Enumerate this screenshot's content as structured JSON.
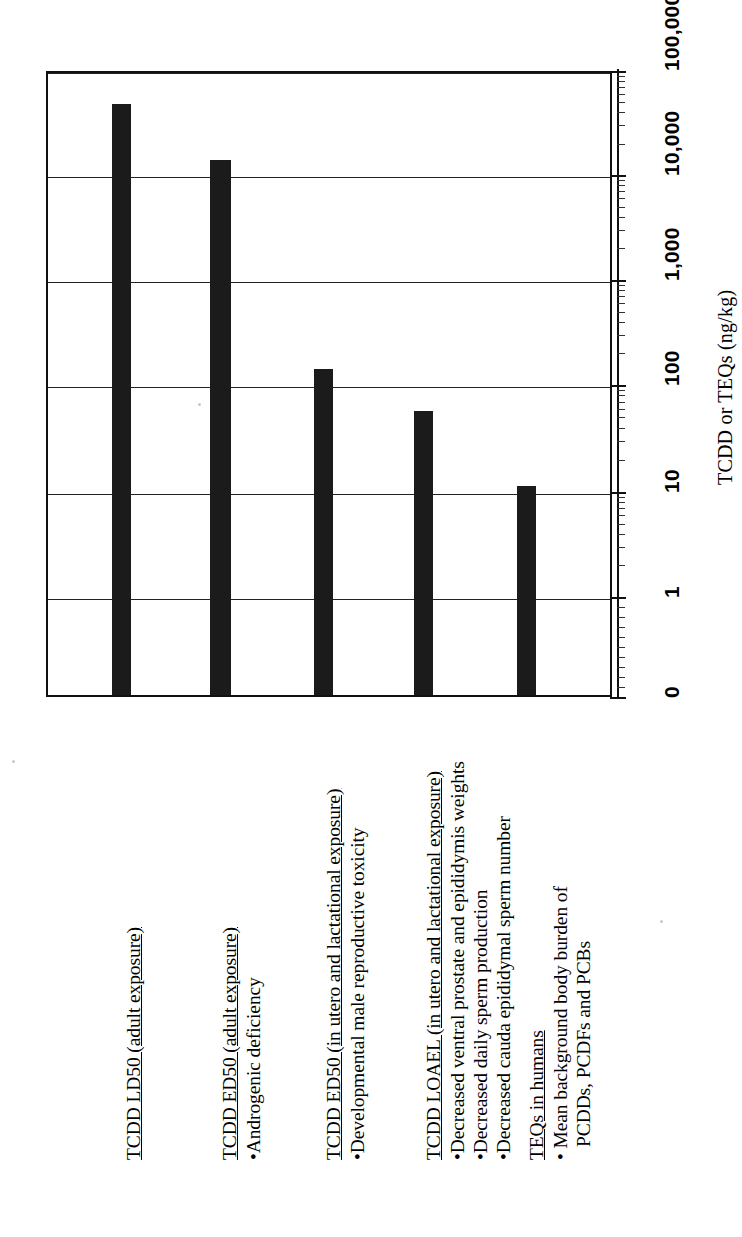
{
  "figure": {
    "orientation": "rotated-90-ccw",
    "background_color": "#ffffff",
    "bar_color": "#1b1b1b",
    "axis_color": "#111111"
  },
  "chart_data": {
    "type": "bar",
    "title": "",
    "subtitle": "",
    "xlabel": "",
    "ylabel": "TCDD or TEQs (ng/kg)",
    "scale": "log",
    "grid": true,
    "legend": null,
    "ylim": [
      0,
      100000
    ],
    "tick_labels": [
      "0",
      "1",
      "10",
      "100",
      "1,000",
      "10,000",
      "100,000"
    ],
    "tick_values": [
      0,
      1,
      10,
      100,
      1000,
      10000,
      100000
    ],
    "categories": [
      "TCDD LD50 (adult exposure)",
      "TCDD ED50 (adult exposure)",
      "TCDD ED50 (in utero and lactational exposure)",
      "TCDD LOAEL (in utero and lactational exposure)",
      "TEQs in humans"
    ],
    "values": [
      50000,
      15000,
      180,
      64,
      13
    ],
    "value_units": "ng/kg"
  },
  "category_blocks": [
    {
      "heading": "TCDD LD50 (adult exposure)",
      "items": []
    },
    {
      "heading": "TCDD ED50 (adult exposure)",
      "items": [
        "•Androgenic deficiency"
      ]
    },
    {
      "heading": "TCDD ED50 (in utero and lactational exposure)",
      "items": [
        "•Developmental male reproductive toxicity"
      ]
    },
    {
      "heading": "TCDD LOAEL (in utero and lactational exposure)",
      "items": [
        "•Decreased ventral prostate and epididymis weights",
        "•Decreased daily sperm production",
        "•Decreased cauda epididymal sperm number"
      ]
    },
    {
      "heading": "TEQs in humans",
      "items": [
        "• Mean background body burden of",
        "PCDDs, PCDFs and PCBs"
      ]
    }
  ],
  "axis": {
    "title": "TCDD or TEQs (ng/kg)",
    "ticks": [
      {
        "label": "100,000",
        "value": 100000
      },
      {
        "label": "10,000",
        "value": 10000
      },
      {
        "label": "1,000",
        "value": 1000
      },
      {
        "label": "100",
        "value": 100
      },
      {
        "label": "10",
        "value": 10
      },
      {
        "label": "1",
        "value": 1
      },
      {
        "label": "0",
        "value": 0
      }
    ]
  }
}
